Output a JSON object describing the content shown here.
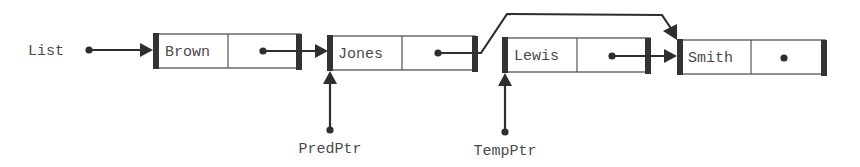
{
  "diagram": {
    "type": "linked-list",
    "colors": {
      "line": "#2e2e2e",
      "bar": "#333333",
      "text": "#4a4a4a",
      "background": "#ffffff"
    },
    "head_pointer": {
      "label": "List"
    },
    "nodes": [
      {
        "id": "n0",
        "value": "Brown",
        "next": "n1"
      },
      {
        "id": "n1",
        "value": "Jones",
        "next": "n3"
      },
      {
        "id": "n2",
        "value": "Lewis",
        "next": "n3"
      },
      {
        "id": "n3",
        "value": "Smith",
        "next": null
      }
    ],
    "pointers": [
      {
        "label": "PredPtr",
        "points_to": "Jones"
      },
      {
        "label": "TempPtr",
        "points_to": "Lewis"
      }
    ],
    "annotation": "Jones' next pointer bypasses Lewis and points directly to Smith"
  }
}
